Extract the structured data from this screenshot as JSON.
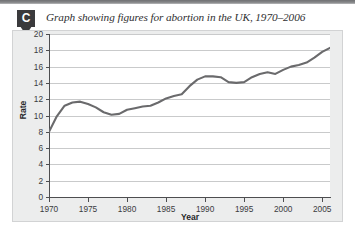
{
  "figure": {
    "badge_label": "C",
    "caption": "Graph showing figures for abortion in the UK, 1970–2006"
  },
  "colors": {
    "line": "#6a6a6c",
    "grid": "#c9cacb",
    "axis": "#4d4e50",
    "panel_bg": "#eceded",
    "plot_bg": "#ffffff",
    "badge_bg": "#3a3a3c",
    "top_rule": "#87888a"
  },
  "chart_data": {
    "type": "line",
    "title": "Graph showing figures for abortion in the UK, 1970–2006",
    "xlabel": "Year",
    "ylabel": "Rate",
    "xlim": [
      1970,
      2006
    ],
    "ylim": [
      0,
      20
    ],
    "xticks": [
      1970,
      1975,
      1980,
      1985,
      1990,
      1995,
      2000,
      2005
    ],
    "yticks": [
      0,
      2,
      4,
      6,
      8,
      10,
      12,
      14,
      16,
      18,
      20
    ],
    "grid": "horizontal",
    "legend": "none",
    "series": [
      {
        "name": "Abortion rate, UK",
        "x": [
          1970,
          1971,
          1972,
          1973,
          1974,
          1975,
          1976,
          1977,
          1978,
          1979,
          1980,
          1981,
          1982,
          1983,
          1984,
          1985,
          1986,
          1987,
          1988,
          1989,
          1990,
          1991,
          1992,
          1993,
          1994,
          1995,
          1996,
          1997,
          1998,
          1999,
          2000,
          2001,
          2002,
          2003,
          2004,
          2005,
          2006
        ],
        "values": [
          8.0,
          9.9,
          11.2,
          11.6,
          11.7,
          11.4,
          11.0,
          10.4,
          10.1,
          10.2,
          10.7,
          10.9,
          11.1,
          11.2,
          11.6,
          12.1,
          12.4,
          12.6,
          13.6,
          14.4,
          14.8,
          14.8,
          14.7,
          14.1,
          14.0,
          14.1,
          14.7,
          15.1,
          15.3,
          15.1,
          15.6,
          16.0,
          16.2,
          16.5,
          17.1,
          17.8,
          18.3
        ]
      }
    ]
  }
}
